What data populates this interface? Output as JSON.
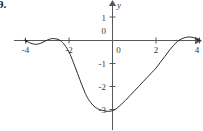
{
  "figure": {
    "problem_number": "9.",
    "axis_color": "#55585c",
    "curve_color": "#2b2b2b",
    "background_color": "#ffffff"
  },
  "chart_data": {
    "type": "line",
    "title": "",
    "subtitle": "",
    "xlabel": "",
    "ylabel": "y",
    "xlim": [
      -4.35,
      4.35
    ],
    "ylim": [
      -3.35,
      1.25
    ],
    "grid": false,
    "legend": null,
    "x_ticks": [
      -4,
      -2,
      0,
      2,
      4
    ],
    "x_tick_labels": [
      "-4",
      "-2",
      "0",
      "2",
      "4"
    ],
    "y_ticks": [
      1,
      0,
      -1,
      -2,
      -3
    ],
    "y_tick_labels": [
      "1",
      "0",
      "-1",
      "-2",
      "-3"
    ],
    "annotations": [],
    "series": [
      {
        "name": "curve",
        "x": [
          -4.0,
          -3.8,
          -3.6,
          -3.4,
          -3.2,
          -3.0,
          -2.8,
          -2.6,
          -2.4,
          -2.2,
          -2.0,
          -1.8,
          -1.6,
          -1.4,
          -1.2,
          -1.0,
          -0.8,
          -0.6,
          -0.4,
          -0.2,
          0.0,
          0.2,
          0.4,
          0.6,
          0.8,
          1.0,
          1.2,
          1.4,
          1.6,
          1.8,
          2.0,
          2.2,
          2.4,
          2.6,
          2.8,
          3.0,
          3.2,
          3.4,
          3.6,
          3.8,
          4.0
        ],
        "y": [
          0.0,
          -0.1,
          -0.16,
          -0.15,
          -0.08,
          0.02,
          0.08,
          0.07,
          0.0,
          -0.2,
          -0.5,
          -0.95,
          -1.45,
          -1.95,
          -2.4,
          -2.7,
          -2.9,
          -3.0,
          -3.05,
          -3.08,
          -3.05,
          -2.95,
          -2.78,
          -2.6,
          -2.4,
          -2.2,
          -2.0,
          -1.8,
          -1.6,
          -1.4,
          -1.2,
          -0.95,
          -0.7,
          -0.45,
          -0.22,
          -0.03,
          0.08,
          0.14,
          0.15,
          0.1,
          0.0
        ]
      }
    ]
  },
  "labels": {
    "y_axis_name": "y"
  }
}
